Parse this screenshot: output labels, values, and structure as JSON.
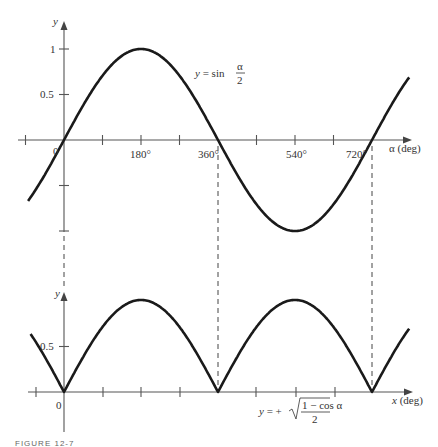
{
  "chart_data": [
    {
      "type": "line",
      "title": "y = sin(α/2)",
      "xlabel": "α (deg)",
      "ylabel": "y",
      "x_ticks": [
        "0",
        "180°",
        "360°",
        "540°",
        "720°"
      ],
      "y_ticks": [
        "1",
        "0.5"
      ],
      "xlim": [
        -115,
        800
      ],
      "ylim": [
        -1.0,
        1.0
      ],
      "grid": false,
      "series": [
        {
          "name": "y = sin(α/2)",
          "x": [
            -90,
            0,
            90,
            180,
            270,
            360,
            450,
            540,
            630,
            720,
            810
          ],
          "values": [
            -0.71,
            0,
            0.71,
            1,
            0.71,
            0,
            -0.71,
            -1,
            -0.71,
            0,
            0.71
          ]
        }
      ],
      "annotation": {
        "text": "y = sin",
        "fraction_num": "α",
        "fraction_den": "2"
      }
    },
    {
      "type": "line",
      "title": "y = +√((1 − cos α)/2)",
      "xlabel": "x (deg)",
      "ylabel": "y",
      "x_ticks": [
        "0"
      ],
      "y_ticks": [
        "0.5"
      ],
      "ylim": [
        0,
        1.0
      ],
      "grid": false,
      "series": [
        {
          "name": "y = +√((1 − cos α)/2)",
          "x": [
            -90,
            0,
            90,
            180,
            270,
            360,
            450,
            540,
            630,
            720,
            810
          ],
          "values": [
            0.71,
            0,
            0.71,
            1,
            0.71,
            0,
            0.71,
            1,
            0.71,
            0,
            0.71
          ]
        }
      ],
      "annotation": {
        "text": "y = +",
        "radicand_num": "1 − cos α",
        "radicand_den": "2"
      }
    }
  ],
  "labels": {
    "top_y": "y",
    "top_one": "1",
    "top_half": "0.5",
    "top_zero": "0",
    "t180": "180°",
    "t360": "360°",
    "t540": "540°",
    "t720": "720°",
    "top_xlabel": "α (deg)",
    "top_formula_prefix": "y = sin",
    "top_formula_num": "α",
    "top_formula_den": "2",
    "bot_y": "y",
    "bot_half": "0.5",
    "bot_zero": "0",
    "bot_xlabel": "x (deg)",
    "bot_formula_prefix": "y = +",
    "bot_formula_num": "1 − cos α",
    "bot_formula_den": "2",
    "caption": "FIGURE 12-7"
  }
}
